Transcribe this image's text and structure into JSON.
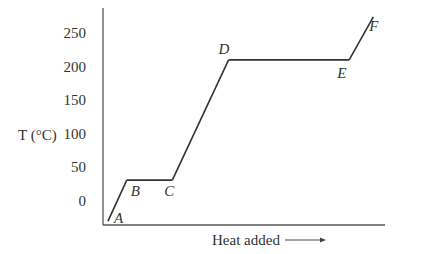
{
  "chart_data": {
    "type": "line",
    "title": "",
    "xlabel": "Heat added",
    "xlabel_arrow": "→",
    "ylabel": "T (°C)",
    "ylim": [
      -32,
      275
    ],
    "yticks": [
      0,
      50,
      100,
      150,
      200,
      250
    ],
    "ytick_labels": [
      "0",
      "50",
      "100",
      "150",
      "200",
      "250"
    ],
    "x_ticks_shown": false,
    "grid": false,
    "legend": "none",
    "xlim": [
      0,
      100
    ],
    "series": [
      {
        "name": "Heating curve",
        "points": [
          {
            "label": "A",
            "x": 0,
            "y": -30
          },
          {
            "label": "B",
            "x": 7,
            "y": 31
          },
          {
            "label": "C",
            "x": 24,
            "y": 31
          },
          {
            "label": "D",
            "x": 45,
            "y": 210
          },
          {
            "label": "E",
            "x": 90,
            "y": 210
          },
          {
            "label": "F",
            "x": 99,
            "y": 274
          }
        ]
      }
    ],
    "point_labels": [
      "A",
      "B",
      "C",
      "D",
      "E",
      "F"
    ]
  }
}
